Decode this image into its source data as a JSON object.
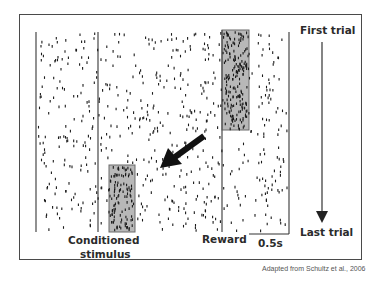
{
  "chart_data": {
    "type": "raster",
    "title": "",
    "xlabel": "Time",
    "ylabel": "Trials (first at top, last at bottom)",
    "scale_bar": {
      "label": "0.5s",
      "duration_s": 0.5
    },
    "events": [
      {
        "name": "Conditioned stimulus",
        "marker": "vertical-line"
      },
      {
        "name": "Reward",
        "marker": "vertical-line"
      }
    ],
    "highlights": [
      {
        "name": "reward-burst",
        "event": "Reward",
        "trials": "first ~50%",
        "color": "#b8b8b8"
      },
      {
        "name": "cs-burst",
        "event": "Conditioned stimulus",
        "trials": "last ~30%",
        "color": "#b8b8b8"
      }
    ],
    "annotations": [
      "First trial",
      "Last trial",
      "arrow: shift of response from reward to conditioned stimulus"
    ],
    "grid": false,
    "legend": null
  },
  "labels": {
    "first_trial": "First trial",
    "last_trial": "Last trial",
    "conditioned": "Conditioned",
    "stimulus": "stimulus",
    "reward": "Reward",
    "scale": "0.5s"
  },
  "caption": "Adapted from Schultz et al., 2006",
  "colors": {
    "ink": "#2b2b2b",
    "box_fill": "#b8b8b8",
    "box_stroke": "#6a6a6a",
    "frame": "#4a4a4a"
  }
}
